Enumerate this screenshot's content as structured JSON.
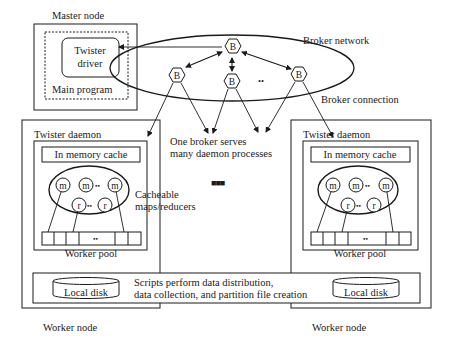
{
  "diagram": {
    "master_node": {
      "title": "Master node",
      "main_program_label": "Main program",
      "driver_line1": "Twister",
      "driver_line2": "driver"
    },
    "broker_network": {
      "label": "Broker network",
      "broker_glyph": "B",
      "ellipsis": "..",
      "connection_label": "Broker connection",
      "serves_line1": "One broker serves",
      "serves_line2": "many daemon processes"
    },
    "worker_left": {
      "daemon_label": "Twister daemon",
      "cache_label": "In memory cache",
      "map_glyph": "m",
      "reduce_glyph": "r",
      "dots": "••",
      "pool_label": "Worker pool",
      "disk_label": "Local disk",
      "node_label": "Worker node"
    },
    "worker_right": {
      "daemon_label": "Twister daemon",
      "cache_label": "In memory cache",
      "map_glyph": "m",
      "reduce_glyph": "r",
      "dots": "••",
      "pool_label": "Worker pool",
      "disk_label": "Local disk",
      "node_label": "Worker node"
    },
    "cacheable_line1": "Cacheable",
    "cacheable_line2": "maps/reducers",
    "middle_ellipsis": "■■■",
    "scripts_line1": "Scripts perform data distribution,",
    "scripts_line2": "data collection, and partition file creation"
  }
}
